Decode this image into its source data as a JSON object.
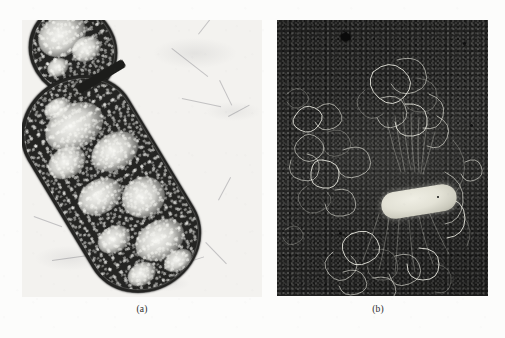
{
  "figure": {
    "kind": "electron-micrograph-plate",
    "panel_count": 2,
    "background_color": "#fcfcfb",
    "panels": [
      {
        "id": "a",
        "caption": "(a)",
        "technique": "transmission electron micrograph, thin section",
        "field_tone": "light",
        "subject": "dividing rod-shaped bacterial cell",
        "features": [
          "cell envelope",
          "dark granular ribosome-rich cytoplasm",
          "light fibrillar nucleoid regions",
          "division septum",
          "smaller daughter cell at upper left"
        ],
        "frame": {
          "x": 22,
          "y": 20,
          "width": 240,
          "height": 277
        },
        "colors": {
          "background": "#f3f2ef",
          "cytoplasm": "#242422",
          "nucleoid": "#fcfcf8"
        }
      },
      {
        "id": "b",
        "caption": "(b)",
        "technique": "Kleinschmidt spread, dark-field electron micrograph",
        "field_tone": "dark",
        "subject": "lysed bacterial cell with released chromosomal DNA",
        "features": [
          "bright rod-shaped lysed cell",
          "released circular chromosome as looping DNA filaments",
          "dense DNA tangle surrounding the cell",
          "dark stain artifact near upper left"
        ],
        "frame": {
          "x": 277,
          "y": 20,
          "width": 211,
          "height": 276
        },
        "colors": {
          "background": "#262625",
          "dna_filament": "#ecece2",
          "cell_body": "#e3e2d6",
          "artifact": "#0b0b0b"
        }
      }
    ],
    "captions": {
      "a": "(a)",
      "b": "(b)"
    }
  }
}
